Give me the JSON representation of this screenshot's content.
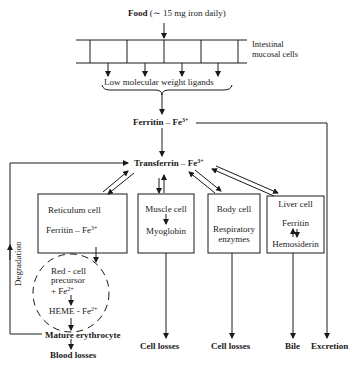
{
  "food": {
    "label": "Food",
    "note": "(∼ 15 mg iron daily)"
  },
  "intestinal": {
    "label_line1": "Intestinal",
    "label_line2": "mucosal cells"
  },
  "ligands": {
    "label": "Low molecular weight ligands"
  },
  "ferritin_top": {
    "label": "Ferritin",
    "dash": "–",
    "ion": "Fe",
    "charge": "3+"
  },
  "transferrin": {
    "label": "Transferrin",
    "dash": "–",
    "ion": "Fe",
    "charge": "3+"
  },
  "boxes": {
    "reticulum": {
      "title": "Reticulum cell",
      "line2": "Ferritin – Fe",
      "charge": "3+"
    },
    "muscle": {
      "title": "Muscle cell",
      "line2": "Myoglobin"
    },
    "body": {
      "title": "Body cell",
      "line2": "Respiratory",
      "line3": "enzymes"
    },
    "liver": {
      "title": "Liver cell",
      "line2": "Ferritin",
      "line3": "Hemosiderin"
    }
  },
  "precursor": {
    "line1": "Red - cell",
    "line2": "precursor",
    "line3": "+ Fe",
    "charge3": "2+",
    "heme": "HEME - Fe",
    "heme_charge": "2+"
  },
  "degradation": {
    "label": "Degradation"
  },
  "outputs": {
    "mature": "Mature erythrocyte",
    "blood_losses": "Blood losses",
    "cell_losses_1": "Cell losses",
    "cell_losses_2": "Cell losses",
    "bile": "Bile",
    "excretion": "Excretion"
  },
  "colors": {
    "ink": "#1a1a1a",
    "background": "#ffffff"
  }
}
